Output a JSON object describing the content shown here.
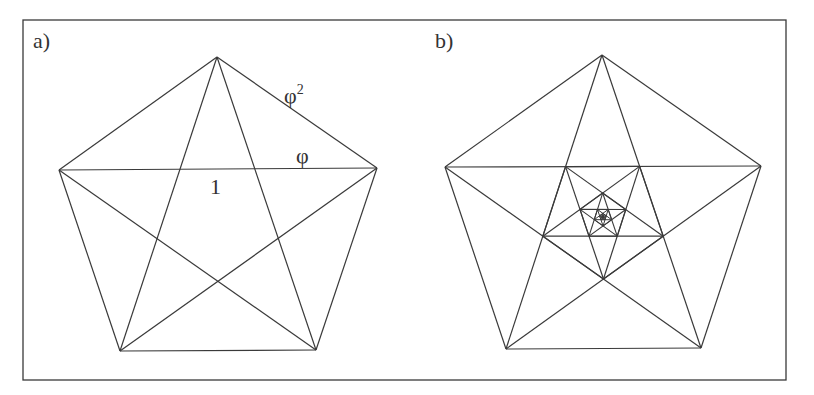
{
  "figure": {
    "frame": {
      "x": 23,
      "y": 20,
      "width": 763,
      "height": 360
    },
    "stroke_color": "#3a3a3a",
    "panels": [
      {
        "id": "a",
        "label": "a)",
        "label_pos": [
          33,
          48
        ],
        "pentagon": [
          [
            217,
            57
          ],
          [
            377,
            168
          ],
          [
            316,
            350
          ],
          [
            120,
            351
          ],
          [
            59,
            170
          ]
        ],
        "recursive_depth": 0,
        "annotations": [
          {
            "text": "φ",
            "sup": "2",
            "x": 284,
            "y": 103
          },
          {
            "text": "φ",
            "sup": "",
            "x": 296,
            "y": 163
          },
          {
            "text": "1",
            "sup": "",
            "x": 210,
            "y": 194
          }
        ]
      },
      {
        "id": "b",
        "label": "b)",
        "label_pos": [
          435,
          48
        ],
        "pentagon": [
          [
            602,
            55
          ],
          [
            761,
            166
          ],
          [
            701,
            348
          ],
          [
            506,
            349
          ],
          [
            445,
            167
          ]
        ],
        "recursive_depth": 6,
        "annotations": []
      }
    ]
  },
  "chart_data": {
    "type": "diagram",
    "title": "",
    "panels": [
      {
        "label": "a)",
        "shape": "regular pentagon with inscribed pentagram",
        "edge_labels": [
          "φ² (pentagon side)",
          "φ (diagonal segment)",
          "1 (inner segment)"
        ]
      },
      {
        "label": "b)",
        "shape": "pentagon with recursively nested inverted pentagons and pentagrams",
        "nesting_levels": 6
      }
    ]
  }
}
